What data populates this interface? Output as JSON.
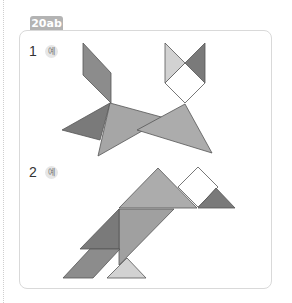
{
  "tag_label": "20ab",
  "problems": [
    {
      "number": "1",
      "example_label": "예",
      "figure": "tangram-cat"
    },
    {
      "number": "2",
      "example_label": "예",
      "figure": "tangram-bird"
    }
  ],
  "colors": {
    "dark": "#7a7a7a",
    "medium": "#a6a6a6",
    "light": "#d2d2d2",
    "white": "#ffffff",
    "stroke": "#555555",
    "tag_bg": "#b3b3b3",
    "border": "#d9d9d9"
  }
}
